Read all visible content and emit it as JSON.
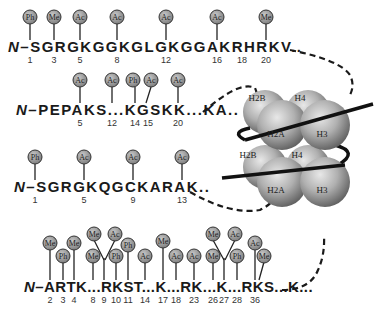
{
  "figure": {
    "type": "histone tail modification diagram",
    "legend_marks": {
      "Ph": "phosphorylation",
      "Me": "methylation",
      "Ac": "acetylation"
    }
  },
  "tails": [
    {
      "name": "H4",
      "nterm": "N–",
      "sequence": "SGRGKGGKGLGKGGAKRHRKV...",
      "residue_numbers": [
        "1",
        "3",
        "5",
        "8",
        "12",
        "16",
        "18",
        "20"
      ],
      "modifications": [
        {
          "pos": "1",
          "mark": "Ph"
        },
        {
          "pos": "3",
          "mark": "Me"
        },
        {
          "pos": "5",
          "mark": "Ac"
        },
        {
          "pos": "8",
          "mark": "Ac"
        },
        {
          "pos": "12",
          "mark": "Ac"
        },
        {
          "pos": "16",
          "mark": "Ac"
        },
        {
          "pos": "20",
          "mark": "Me"
        }
      ]
    },
    {
      "name": "H2B",
      "nterm": "N–",
      "sequence": "PEPAKS...KGSKK...KA..",
      "residue_numbers": [
        "5",
        "12",
        "14",
        "15",
        "20"
      ],
      "modifications": [
        {
          "pos": "5",
          "mark": "Ac"
        },
        {
          "pos": "12",
          "mark": "Ac"
        },
        {
          "pos": "14",
          "mark": "Ph"
        },
        {
          "pos": "15",
          "mark": "Ac"
        },
        {
          "pos": "20",
          "mark": "Ac"
        }
      ]
    },
    {
      "name": "H2A",
      "nterm": "N–",
      "sequence": "SGRGKQGCKARAK..",
      "residue_numbers": [
        "1",
        "5",
        "9",
        "13"
      ],
      "modifications": [
        {
          "pos": "1",
          "mark": "Ph"
        },
        {
          "pos": "5",
          "mark": "Ac"
        },
        {
          "pos": "9",
          "mark": "Ac"
        },
        {
          "pos": "13",
          "mark": "Ac"
        }
      ]
    },
    {
      "name": "H3",
      "nterm": "N–",
      "sequence": "ARTK...RKST...K...RK...K...RKS...K...",
      "residue_numbers": [
        "2",
        "3",
        "4",
        "8",
        "9",
        "10",
        "11",
        "14",
        "17",
        "18",
        "23",
        "26",
        "27",
        "28",
        "36"
      ],
      "modifications": [
        {
          "pos": "2",
          "mark": "Me"
        },
        {
          "pos": "3",
          "mark": "Ph"
        },
        {
          "pos": "4",
          "mark": "Me"
        },
        {
          "pos": "8",
          "mark": "Me"
        },
        {
          "pos": "9",
          "mark": "Me"
        },
        {
          "pos": "9",
          "mark": "Ac"
        },
        {
          "pos": "10",
          "mark": "Ph"
        },
        {
          "pos": "11",
          "mark": "Ph"
        },
        {
          "pos": "14",
          "mark": "Ac"
        },
        {
          "pos": "17",
          "mark": "Me"
        },
        {
          "pos": "18",
          "mark": "Ac"
        },
        {
          "pos": "23",
          "mark": "Ac"
        },
        {
          "pos": "26",
          "mark": "Me"
        },
        {
          "pos": "27",
          "mark": "Me"
        },
        {
          "pos": "27",
          "mark": "Ac"
        },
        {
          "pos": "28",
          "mark": "Ph"
        },
        {
          "pos": "36",
          "mark": "Ac"
        },
        {
          "pos": "36",
          "mark": "Me"
        }
      ]
    }
  ],
  "nucleosome": {
    "histones_top": [
      "H2B",
      "H4",
      "H2A",
      "H3"
    ],
    "histones_bottom": [
      "H2B",
      "H4",
      "H2A",
      "H3"
    ]
  },
  "labels": {
    "row1": {
      "nterm": "N–",
      "seq": "SGRGKGGKGLGKGGAKRHRKV..",
      "nums": [
        "1",
        "3",
        "5",
        "8",
        "12",
        "16",
        "18",
        "20"
      ],
      "marks": [
        "Ph",
        "Me",
        "Ac",
        "Ac",
        "Ac",
        "Ac",
        "Me"
      ]
    },
    "row2": {
      "nterm": "N–",
      "seq": "PEPAKS...KGSKK...KA..",
      "nums": [
        "5",
        "12",
        "14",
        "15",
        "20"
      ],
      "marks": [
        "Ac",
        "Ac",
        "Ph",
        "Ac",
        "Ac"
      ]
    },
    "row3": {
      "nterm": "N–",
      "seq": "SGRGKQGCKARAK..",
      "nums": [
        "1",
        "5",
        "9",
        "13"
      ],
      "marks": [
        "Ph",
        "Ac",
        "Ac",
        "Ac"
      ]
    },
    "row4": {
      "nterm": "N–",
      "seq": "ARTK...RKST...K...RK...K...RKS...K...",
      "nums": [
        "2",
        "3",
        "4",
        "8",
        "9",
        "10",
        "11",
        "14",
        "17",
        "18",
        "23",
        "26",
        "27",
        "28",
        "36"
      ],
      "marks": [
        "Me",
        "Ph",
        "Me",
        "Me",
        "Me",
        "Ac",
        "Ph",
        "Ph",
        "Ac",
        "Me",
        "Ac",
        "Ac",
        "Me",
        "Me",
        "Ac",
        "Ph",
        "Ac",
        "Me"
      ]
    },
    "histones": [
      "H2B",
      "H4",
      "H2A",
      "H3",
      "H2B",
      "H4",
      "H2A",
      "H3"
    ]
  }
}
